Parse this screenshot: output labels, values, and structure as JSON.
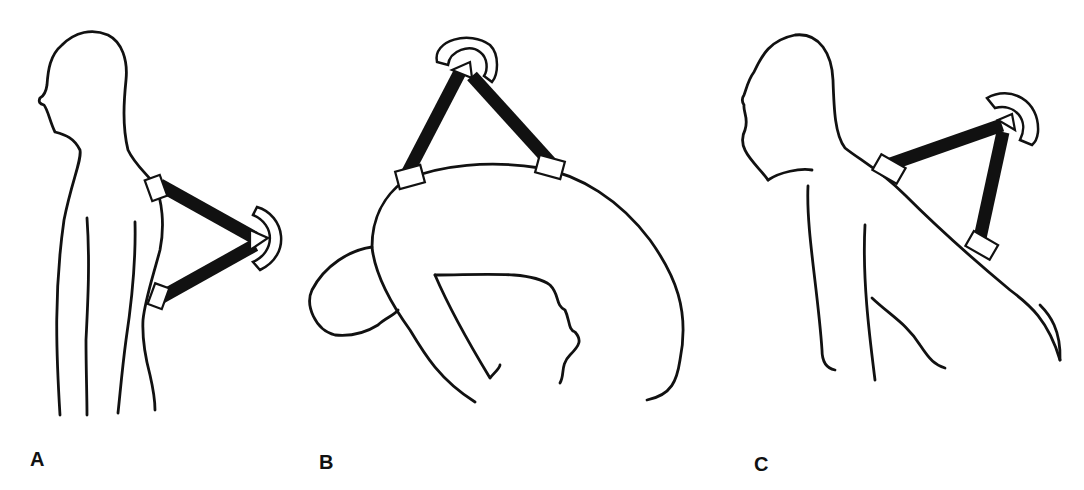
{
  "figure": {
    "panels": [
      {
        "id": "A",
        "label": "A",
        "description": "Standing upright, lateral view, goniometer strapped to upper back"
      },
      {
        "id": "B",
        "label": "B",
        "description": "Forward flexion of the trunk, goniometer on top of curved back"
      },
      {
        "id": "C",
        "label": "C",
        "description": "Extension with head tilted back, goniometer on upper back"
      }
    ],
    "colors": {
      "line": "#111111",
      "background": "#ffffff",
      "arms": "#111111"
    }
  }
}
